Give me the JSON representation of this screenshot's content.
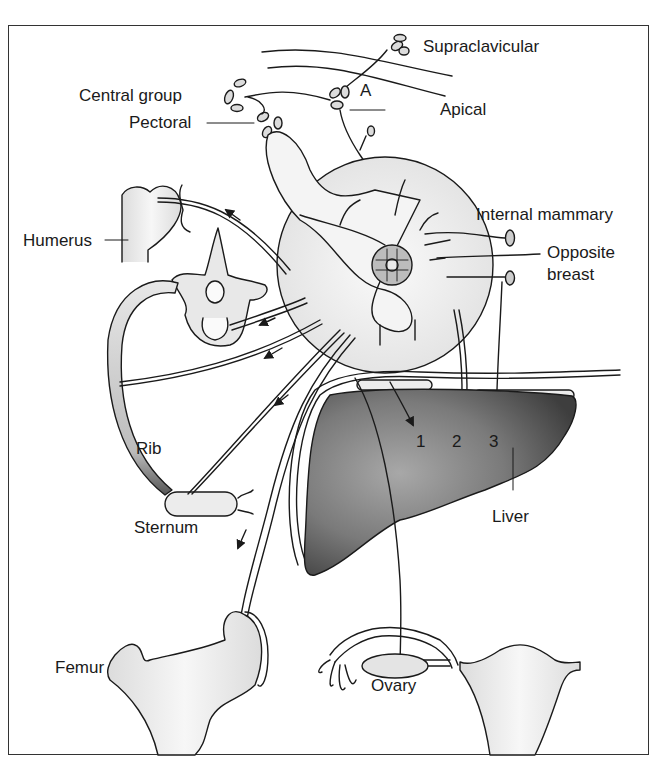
{
  "figure": {
    "colors": {
      "stroke": "#1a1a1a",
      "bone_fill": "#ececec",
      "breast_fill": "#eeeeee",
      "liver_dark": "#4a4a4a",
      "liver_light": "#9a9a9a",
      "frame": "#333333"
    }
  },
  "labels": {
    "supraclavicular": "Supraclavicular",
    "central_group": "Central group",
    "a_marker": "A",
    "apical": "Apical",
    "pectoral": "Pectoral",
    "internal_mammary": "Internal mammary",
    "humerus": "Humerus",
    "opposite": "Opposite",
    "breast": "breast",
    "rib": "Rib",
    "sternum": "Sternum",
    "liver": "Liver",
    "route_1": "1",
    "route_2": "2",
    "route_3": "3",
    "femur": "Femur",
    "ovary": "Ovary"
  }
}
